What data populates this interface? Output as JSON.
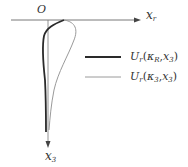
{
  "diagram": {
    "origin_label": "O",
    "x_axis_label": "x",
    "x_axis_label_sub": "r",
    "y_axis_label": "x",
    "y_axis_label_sub": "3",
    "legend": [
      {
        "fn": "U",
        "fn_sub": "r",
        "args_open": "(",
        "arg1": "κ",
        "arg1_sub": "R",
        "sep": ",",
        "arg2": "x",
        "arg2_sub": "3",
        "args_close": ")",
        "style": "thick",
        "color": "#2a2a2a"
      },
      {
        "fn": "U",
        "fn_sub": "r",
        "args_open": "(",
        "arg1": "κ",
        "arg1_sub": "3",
        "sep": ",",
        "arg2": "x",
        "arg2_sub": "3",
        "args_close": ")",
        "style": "thin",
        "color": "#9a9a9a"
      }
    ],
    "colors": {
      "axis": "#555555",
      "curve_thick": "#2a2a2a",
      "curve_thin": "#9a9a9a"
    }
  }
}
